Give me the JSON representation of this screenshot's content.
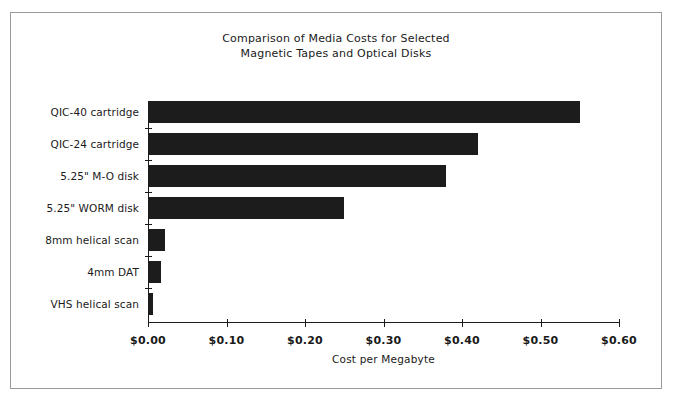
{
  "chart_data": {
    "type": "bar",
    "orientation": "horizontal",
    "title": "Comparison of Media Costs for Selected Magnetic Tapes and Optical Disks",
    "title_lines": [
      "Comparison of Media Costs for Selected",
      "Magnetic Tapes and Optical Disks"
    ],
    "categories": [
      "QIC-40 cartridge",
      "QIC-24 cartridge",
      "5.25\" M-O disk",
      "5.25\" WORM disk",
      "8mm helical scan",
      "4mm DAT",
      "VHS helical scan"
    ],
    "values": [
      0.55,
      0.42,
      0.38,
      0.25,
      0.022,
      0.017,
      0.006
    ],
    "xlabel": "Cost per Megabyte",
    "ylabel": "",
    "xlim": [
      0,
      0.6
    ],
    "xticks": [
      0,
      0.1,
      0.2,
      0.3,
      0.4,
      0.5,
      0.6
    ],
    "xtick_labels": [
      "$0.00",
      "$0.10",
      "$0.20",
      "$0.30",
      "$0.40",
      "$0.50",
      "$0.60"
    ],
    "grid": false,
    "legend": null,
    "bar_color": "#1c1c1c",
    "axis_color": "#1a1a1a",
    "background_color": "#ffffff",
    "frame_border_color": "#9a9a9a"
  }
}
